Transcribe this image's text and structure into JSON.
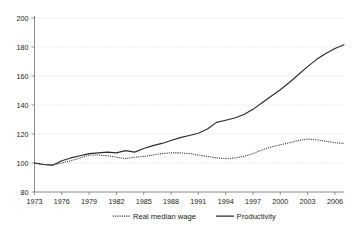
{
  "chart_data": {
    "type": "line",
    "title": "",
    "subtitle": "",
    "xlabel": "",
    "ylabel": "",
    "xlim": [
      1973,
      2007
    ],
    "ylim": [
      80,
      200
    ],
    "grid": true,
    "legend_position": "bottom",
    "y_ticks": [
      80,
      100,
      120,
      140,
      160,
      180,
      200
    ],
    "x_ticks": [
      1973,
      1976,
      1979,
      1982,
      1985,
      1988,
      1991,
      1994,
      1997,
      2000,
      2003,
      2006
    ],
    "x": [
      1973,
      1974,
      1975,
      1976,
      1977,
      1978,
      1979,
      1980,
      1981,
      1982,
      1983,
      1984,
      1985,
      1986,
      1987,
      1988,
      1989,
      1990,
      1991,
      1992,
      1993,
      1994,
      1995,
      1996,
      1997,
      1998,
      1999,
      2000,
      2001,
      2002,
      2003,
      2004,
      2005,
      2006,
      2007
    ],
    "series": [
      {
        "name": "Real median wage",
        "style": "dotted",
        "color": "#2b2b2b",
        "values": [
          100,
          99,
          98.5,
          100,
          101.5,
          103.5,
          105.5,
          105.5,
          105,
          104,
          103,
          104,
          104.5,
          105.5,
          106.5,
          107,
          107,
          106.5,
          105.5,
          104.5,
          103.5,
          103,
          103.5,
          104.5,
          106.5,
          109,
          111,
          112.5,
          114,
          115.5,
          116.5,
          116,
          115,
          114,
          113.5
        ]
      },
      {
        "name": "Productivity",
        "style": "solid",
        "color": "#2b2b2b",
        "values": [
          100,
          99,
          98.5,
          101.5,
          103.5,
          105,
          106.5,
          107,
          107.5,
          107,
          108.5,
          107.5,
          110,
          112,
          113.5,
          115.5,
          117.5,
          119,
          120.5,
          123.5,
          128,
          129.5,
          131,
          133.5,
          137,
          141.5,
          146,
          150.5,
          155.5,
          161,
          166.5,
          171.5,
          175.5,
          179,
          181.5
        ]
      }
    ]
  },
  "legend": {
    "entries": [
      {
        "label": "Real median wage",
        "style": "dotted"
      },
      {
        "label": "Productivity",
        "style": "solid"
      }
    ]
  },
  "axes": {
    "y_tick_labels": [
      "200",
      "180",
      "160",
      "140",
      "120",
      "100",
      "80"
    ],
    "x_tick_labels": [
      "1973",
      "1976",
      "1979",
      "1982",
      "1985",
      "1988",
      "1991",
      "1994",
      "1997",
      "2000",
      "2003",
      "2006"
    ]
  },
  "colors": {
    "line": "#2b2b2b",
    "gridline": "#c9c9c9",
    "axis": "#6b6b6b",
    "background": "#ffffff",
    "text": "#1a1a1a"
  }
}
